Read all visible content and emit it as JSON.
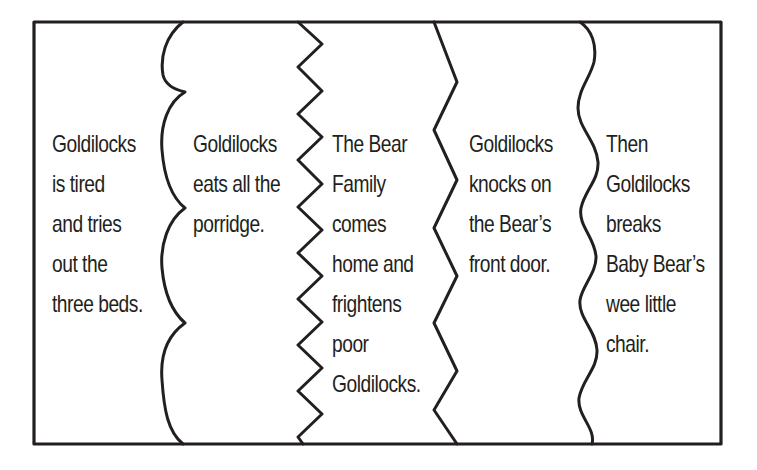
{
  "diagram": {
    "type": "story-sequencing-strips",
    "colors": {
      "background": "#ffffff",
      "stroke": "#231f20",
      "text": "#231f20"
    },
    "frame": {
      "x": 34,
      "y": 22,
      "width": 687,
      "height": 422
    },
    "dividers": [
      {
        "name": "scalloped-divider",
        "style": "scallop"
      },
      {
        "name": "small-zigzag-divider",
        "style": "zigzag-small"
      },
      {
        "name": "large-zigzag-divider",
        "style": "zigzag-large"
      },
      {
        "name": "wavy-divider",
        "style": "wave"
      }
    ],
    "panels": [
      {
        "id": "panel-1",
        "lines": [
          "Goldilocks",
          "is tired",
          "and tries",
          "out the",
          "three beds."
        ]
      },
      {
        "id": "panel-2",
        "lines": [
          "Goldilocks",
          "eats all the",
          "porridge."
        ]
      },
      {
        "id": "panel-3",
        "lines": [
          "The Bear",
          "Family",
          "comes",
          "home and",
          "frightens",
          "poor",
          "Goldilocks."
        ]
      },
      {
        "id": "panel-4",
        "lines": [
          "Goldilocks",
          "knocks on",
          "the Bear’s",
          "front door."
        ]
      },
      {
        "id": "panel-5",
        "lines": [
          "Then",
          "Goldilocks",
          "breaks",
          "Baby Bear’s",
          "wee little",
          "chair."
        ]
      }
    ]
  }
}
